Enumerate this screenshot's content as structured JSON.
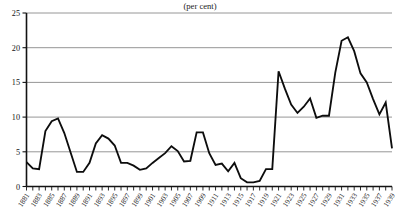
{
  "chart_data": {
    "type": "line",
    "title": "",
    "subtitle": "(per cent)",
    "xlabel": "",
    "ylabel": "",
    "ylim": [
      0,
      25
    ],
    "xlim": [
      1881,
      1939
    ],
    "y_ticks": [
      0,
      5,
      10,
      15,
      20,
      25
    ],
    "grid": true,
    "legend": "none",
    "x_tick_labels": [
      "1881",
      "1883",
      "1885",
      "1887",
      "1889",
      "1891",
      "1893",
      "1895",
      "1897",
      "1899",
      "1901",
      "1903",
      "1905",
      "1907",
      "1909",
      "1911",
      "1913",
      "1915",
      "1917",
      "1919",
      "1921",
      "1923",
      "1925",
      "1927",
      "1929",
      "1931",
      "1933",
      "1935",
      "1937",
      "1939"
    ],
    "x": [
      1881,
      1882,
      1883,
      1884,
      1885,
      1886,
      1887,
      1888,
      1889,
      1890,
      1891,
      1892,
      1893,
      1894,
      1895,
      1896,
      1897,
      1898,
      1899,
      1900,
      1901,
      1902,
      1903,
      1904,
      1905,
      1906,
      1907,
      1908,
      1909,
      1910,
      1911,
      1912,
      1913,
      1914,
      1915,
      1916,
      1917,
      1918,
      1919,
      1920,
      1921,
      1922,
      1923,
      1924,
      1925,
      1926,
      1927,
      1928,
      1929,
      1930,
      1931,
      1932,
      1933,
      1934,
      1935,
      1936,
      1937,
      1938,
      1939
    ],
    "values": [
      3.5,
      2.6,
      2.5,
      8.0,
      9.4,
      9.8,
      7.7,
      4.9,
      2.1,
      2.1,
      3.4,
      6.2,
      7.4,
      6.9,
      5.9,
      3.4,
      3.4,
      3.0,
      2.4,
      2.6,
      3.4,
      4.1,
      4.8,
      5.8,
      5.1,
      3.6,
      3.7,
      7.8,
      7.8,
      4.8,
      3.1,
      3.3,
      2.2,
      3.4,
      1.2,
      0.6,
      0.6,
      0.8,
      2.5,
      2.5,
      16.6,
      14.1,
      11.8,
      10.6,
      11.5,
      12.7,
      9.9,
      10.2,
      10.2,
      16.4,
      21.0,
      21.5,
      19.5,
      16.3,
      15.0,
      12.6,
      10.4,
      12.1,
      5.5
    ],
    "series_name": "unemployment-rate"
  },
  "axis": {
    "y_axis_name": "y-axis",
    "x_axis_name": "x-axis"
  }
}
